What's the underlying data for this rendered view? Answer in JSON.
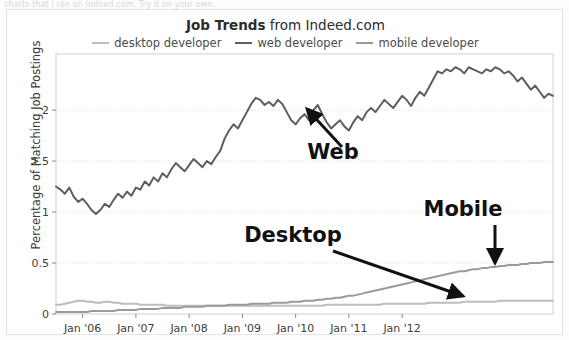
{
  "top_strip": {
    "partial_text": "charts that I ran on Indeed.com. Try it on your own."
  },
  "title": {
    "bold_part": "Job Trends",
    "rest_part": " from Indeed.com"
  },
  "legend": {
    "position": "top-center",
    "items": [
      {
        "label": "desktop developer",
        "color": "#bdbdbd"
      },
      {
        "label": "web developer",
        "color": "#5e5e5e"
      },
      {
        "label": "mobile developer",
        "color": "#9a9a9a"
      }
    ]
  },
  "annotations": [
    {
      "name": "web",
      "label": "Web",
      "x": 332,
      "y": 158,
      "font_size": 21
    },
    {
      "name": "desktop",
      "label": "Desktop",
      "x": 292,
      "y": 241,
      "font_size": 21
    },
    {
      "name": "mobile",
      "label": "Mobile",
      "x": 462,
      "y": 215,
      "font_size": 21
    }
  ],
  "chart_data": {
    "type": "line",
    "title": "Job Trends from Indeed.com",
    "xlabel": "",
    "ylabel": "Percentage of Matching Job Postings",
    "ylim": [
      0,
      2.55
    ],
    "yticks": [
      "0",
      "0.5",
      "1",
      "1.5",
      "2"
    ],
    "ytick_values": [
      0,
      0.5,
      1,
      1.5,
      2
    ],
    "grid": true,
    "xlim": [
      "2005-07",
      "2012-12"
    ],
    "xticks": [
      "Jan '06",
      "Jan '07",
      "Jan '08",
      "Jan '09",
      "Jan '10",
      "Jan '11",
      "Jan '12"
    ],
    "xtick_values": [
      2006,
      2007,
      2008,
      2009,
      2010,
      2011,
      2012
    ],
    "series": [
      {
        "name": "web developer",
        "color": "#5e5e5e",
        "values": [
          1.25,
          1.22,
          1.18,
          1.24,
          1.15,
          1.1,
          1.13,
          1.08,
          1.02,
          0.98,
          1.02,
          1.08,
          1.05,
          1.12,
          1.18,
          1.14,
          1.2,
          1.16,
          1.24,
          1.22,
          1.3,
          1.26,
          1.34,
          1.3,
          1.38,
          1.34,
          1.42,
          1.48,
          1.44,
          1.4,
          1.46,
          1.52,
          1.48,
          1.44,
          1.5,
          1.47,
          1.54,
          1.6,
          1.72,
          1.8,
          1.86,
          1.82,
          1.9,
          1.98,
          2.06,
          2.12,
          2.1,
          2.05,
          2.08,
          2.04,
          2.1,
          2.06,
          1.98,
          1.9,
          1.86,
          1.92,
          1.96,
          1.9,
          2.0,
          2.05,
          1.96,
          1.88,
          1.82,
          1.86,
          1.9,
          1.84,
          1.8,
          1.88,
          1.94,
          1.9,
          1.98,
          2.02,
          1.98,
          2.04,
          2.1,
          2.06,
          2.02,
          2.08,
          2.14,
          2.1,
          2.04,
          2.12,
          2.18,
          2.14,
          2.22,
          2.3,
          2.38,
          2.36,
          2.4,
          2.38,
          2.42,
          2.4,
          2.36,
          2.42,
          2.4,
          2.38,
          2.36,
          2.4,
          2.38,
          2.42,
          2.4,
          2.36,
          2.38,
          2.34,
          2.28,
          2.32,
          2.26,
          2.2,
          2.24,
          2.18,
          2.12,
          2.16,
          2.14
        ]
      },
      {
        "name": "mobile developer",
        "color": "#9a9a9a",
        "values": [
          0.02,
          0.02,
          0.02,
          0.02,
          0.02,
          0.02,
          0.02,
          0.02,
          0.03,
          0.03,
          0.03,
          0.03,
          0.03,
          0.03,
          0.04,
          0.04,
          0.04,
          0.04,
          0.04,
          0.05,
          0.05,
          0.05,
          0.05,
          0.05,
          0.06,
          0.06,
          0.06,
          0.06,
          0.06,
          0.07,
          0.07,
          0.07,
          0.07,
          0.07,
          0.08,
          0.08,
          0.08,
          0.08,
          0.08,
          0.09,
          0.09,
          0.09,
          0.09,
          0.09,
          0.1,
          0.1,
          0.1,
          0.1,
          0.1,
          0.11,
          0.11,
          0.11,
          0.11,
          0.12,
          0.12,
          0.12,
          0.13,
          0.13,
          0.13,
          0.14,
          0.14,
          0.15,
          0.15,
          0.16,
          0.16,
          0.17,
          0.18,
          0.18,
          0.19,
          0.2,
          0.21,
          0.22,
          0.23,
          0.24,
          0.25,
          0.26,
          0.27,
          0.28,
          0.29,
          0.3,
          0.31,
          0.32,
          0.33,
          0.34,
          0.35,
          0.36,
          0.37,
          0.38,
          0.39,
          0.4,
          0.41,
          0.42,
          0.42,
          0.43,
          0.44,
          0.44,
          0.45,
          0.45,
          0.46,
          0.46,
          0.47,
          0.47,
          0.48,
          0.48,
          0.48,
          0.49,
          0.49,
          0.5,
          0.5,
          0.5,
          0.51,
          0.51,
          0.51
        ]
      },
      {
        "name": "desktop developer",
        "color": "#bdbdbd",
        "values": [
          0.09,
          0.09,
          0.1,
          0.11,
          0.12,
          0.13,
          0.13,
          0.12,
          0.12,
          0.11,
          0.11,
          0.12,
          0.12,
          0.11,
          0.11,
          0.1,
          0.1,
          0.1,
          0.1,
          0.09,
          0.09,
          0.09,
          0.09,
          0.09,
          0.09,
          0.08,
          0.08,
          0.08,
          0.08,
          0.08,
          0.08,
          0.08,
          0.08,
          0.08,
          0.08,
          0.08,
          0.08,
          0.08,
          0.08,
          0.08,
          0.08,
          0.08,
          0.08,
          0.08,
          0.08,
          0.08,
          0.08,
          0.08,
          0.08,
          0.08,
          0.08,
          0.08,
          0.08,
          0.08,
          0.08,
          0.08,
          0.08,
          0.08,
          0.08,
          0.08,
          0.08,
          0.09,
          0.09,
          0.09,
          0.09,
          0.09,
          0.09,
          0.09,
          0.09,
          0.09,
          0.09,
          0.09,
          0.09,
          0.09,
          0.1,
          0.1,
          0.1,
          0.1,
          0.1,
          0.1,
          0.1,
          0.1,
          0.1,
          0.1,
          0.11,
          0.11,
          0.11,
          0.11,
          0.11,
          0.11,
          0.11,
          0.11,
          0.12,
          0.12,
          0.12,
          0.12,
          0.12,
          0.12,
          0.12,
          0.12,
          0.13,
          0.13,
          0.13,
          0.13,
          0.13,
          0.13,
          0.13,
          0.13,
          0.13,
          0.13,
          0.13,
          0.13,
          0.13
        ]
      }
    ]
  },
  "plot_geometry": {
    "left": 49,
    "right": 546,
    "top": 44,
    "bottom": 304
  }
}
